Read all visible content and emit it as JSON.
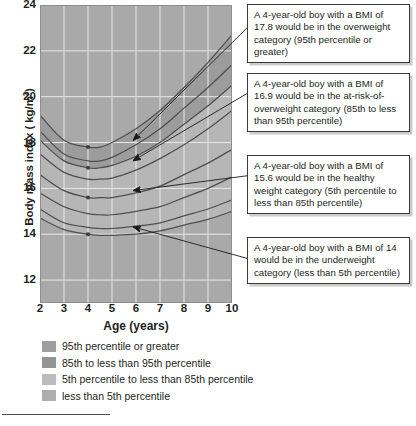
{
  "chart_data": {
    "type": "line",
    "title": "",
    "xlabel": "Age (years)",
    "ylabel": "Body mass index ( kg/m2)",
    "ylabel_prefix": "Body mass index ( kg/m",
    "ylabel_sup": "2",
    "ylabel_suffix": ")",
    "xlim": [
      2,
      10
    ],
    "ylim": [
      11,
      24
    ],
    "xticks": [
      2,
      3,
      4,
      5,
      6,
      7,
      8,
      9,
      10
    ],
    "yticks": [
      12,
      14,
      16,
      18,
      20,
      22,
      24
    ],
    "grid": true,
    "legend_position": "below-plot",
    "series": [
      {
        "name": "95th percentile",
        "x": [
          2,
          3,
          4,
          4.5,
          5,
          6,
          7,
          8,
          9,
          10
        ],
        "values": [
          19.2,
          18.1,
          17.8,
          17.8,
          18.0,
          18.6,
          19.4,
          20.4,
          21.5,
          22.7
        ]
      },
      {
        "name": "90th percentile",
        "x": [
          2,
          3,
          4,
          4.5,
          5,
          6,
          7,
          8,
          9,
          10
        ],
        "values": [
          18.5,
          17.5,
          17.2,
          17.2,
          17.35,
          17.9,
          18.6,
          19.5,
          20.4,
          21.4
        ]
      },
      {
        "name": "85th percentile",
        "x": [
          2,
          3,
          4,
          4.5,
          5,
          6,
          7,
          8,
          9,
          10
        ],
        "values": [
          18.1,
          17.2,
          16.9,
          16.9,
          17.0,
          17.4,
          18.0,
          18.8,
          19.6,
          20.5
        ]
      },
      {
        "name": "75th percentile",
        "x": [
          2,
          3,
          4,
          4.5,
          5,
          6,
          7,
          8,
          9,
          10
        ],
        "values": [
          17.5,
          16.7,
          16.4,
          16.4,
          16.45,
          16.8,
          17.3,
          17.9,
          18.6,
          19.4
        ]
      },
      {
        "name": "50th percentile",
        "x": [
          2,
          3,
          4,
          4.5,
          5,
          6,
          7,
          8,
          9,
          10
        ],
        "values": [
          16.6,
          15.9,
          15.6,
          15.6,
          15.6,
          15.8,
          16.1,
          16.6,
          17.1,
          17.7
        ]
      },
      {
        "name": "25th percentile",
        "x": [
          2,
          3,
          4,
          4.5,
          5,
          6,
          7,
          8,
          9,
          10
        ],
        "values": [
          15.8,
          15.2,
          14.9,
          14.85,
          14.85,
          15.0,
          15.2,
          15.6,
          16.0,
          16.5
        ]
      },
      {
        "name": "10th percentile",
        "x": [
          2,
          3,
          4,
          4.5,
          5,
          6,
          7,
          8,
          9,
          10
        ],
        "values": [
          15.1,
          14.5,
          14.3,
          14.25,
          14.25,
          14.35,
          14.5,
          14.8,
          15.1,
          15.5
        ]
      },
      {
        "name": "5th percentile",
        "x": [
          2,
          3,
          4,
          4.5,
          5,
          6,
          7,
          8,
          9,
          10
        ],
        "values": [
          14.7,
          14.2,
          14.0,
          13.95,
          13.95,
          14.0,
          14.15,
          14.4,
          14.65,
          15.0
        ]
      }
    ],
    "markers": [
      {
        "label": "overweight-marker",
        "x": 4,
        "y": 17.8
      },
      {
        "label": "at-risk-marker",
        "x": 4,
        "y": 16.9
      },
      {
        "label": "healthy-marker",
        "x": 4,
        "y": 15.6
      },
      {
        "label": "underweight-marker",
        "x": 4,
        "y": 14.0
      }
    ],
    "band_colors": {
      "above_95th": "#a9a9a9",
      "85th_to_95th": "#9c9c9c",
      "5th_to_85th": "#b6b6b6",
      "below_5th": "#a9a9a9"
    },
    "curve_color": "#4f4f4f",
    "grid_color": "#e8e8e8"
  },
  "annotations": [
    {
      "name": "callout-overweight",
      "text": "A 4-year-old boy with a BMI of 17.8 would be in the overweight category (95th percentile or greater)"
    },
    {
      "name": "callout-at-risk",
      "text": "A 4-year-old boy with a BMI of 16.9 would be in the at-risk-of-overweight category (85th to less than 95th percentile)"
    },
    {
      "name": "callout-healthy",
      "text": "A 4-year-old boy with a BMI of 15.6 would be in the healthy weight category (5th percentile to less than 85th percentile)"
    },
    {
      "name": "callout-underweight",
      "text": "A 4-year-old boy with a BMI of 14 would be in the underweight category (less than 5th percentile)"
    }
  ],
  "legend": {
    "items": [
      {
        "label": "95th percentile or greater",
        "color": "#9e9e9e"
      },
      {
        "label": "85th to less than 95th percentile",
        "color": "#949494"
      },
      {
        "label": "5th percentile to less than 85th percentile",
        "color": "#bcbcbc"
      },
      {
        "label": "less than 5th percentile",
        "color": "#aeaeae"
      }
    ]
  }
}
